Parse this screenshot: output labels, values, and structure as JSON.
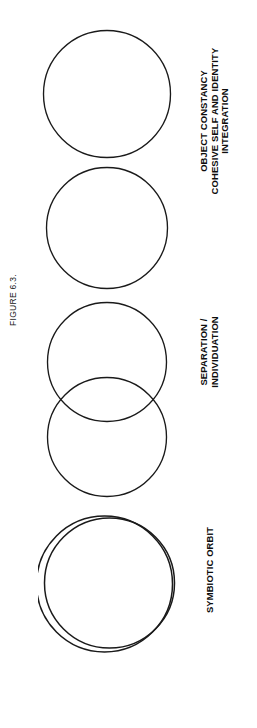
{
  "figure": {
    "caption": "FIGURE 6.3.",
    "background_color": "#ffffff",
    "stroke_color": "#1a1a1a",
    "text_color": "#0d0d0d",
    "orientation": "rotated-90-ccw"
  },
  "stages": [
    {
      "id": "object-constancy",
      "label_lines": [
        "OBJECT CONSTANCY",
        "COHESIVE SELF AND IDENTITY",
        "INTEGRATION"
      ],
      "line1": "OBJECT CONSTANCY",
      "line2": "COHESIVE SELF AND IDENTITY",
      "line3": "INTEGRATION",
      "shape": "two-separate-circles",
      "circle_count": 2
    },
    {
      "id": "separation-individuation",
      "label_lines": [
        "SEPARATION /",
        "INDIVIDUATION"
      ],
      "line1": "SEPARATION /",
      "line2": "INDIVIDUATION",
      "shape": "two-overlapping-circles",
      "circle_count": 2
    },
    {
      "id": "symbiotic-orbit",
      "label_lines": [
        "SYMBIOTIC ORBIT"
      ],
      "line1": "SYMBIOTIC ORBIT",
      "shape": "two-nearly-concentric-circles",
      "circle_count": 2
    }
  ]
}
